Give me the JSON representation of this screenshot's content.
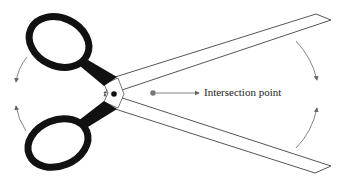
{
  "diagram": {
    "labels": {
      "intersection": "Intersection point"
    },
    "colors": {
      "handle": "#111111",
      "blade_outline": "#555555",
      "arrow": "#666666",
      "intersection_dot": "#777777",
      "pivot_dot": "#111111"
    },
    "annotations": [
      {
        "id": "top-handle-rotation",
        "direction": "counterclockwise-down"
      },
      {
        "id": "bottom-handle-rotation",
        "direction": "clockwise-up"
      },
      {
        "id": "top-blade-rotation",
        "direction": "down"
      },
      {
        "id": "bottom-blade-rotation",
        "direction": "up"
      }
    ]
  }
}
